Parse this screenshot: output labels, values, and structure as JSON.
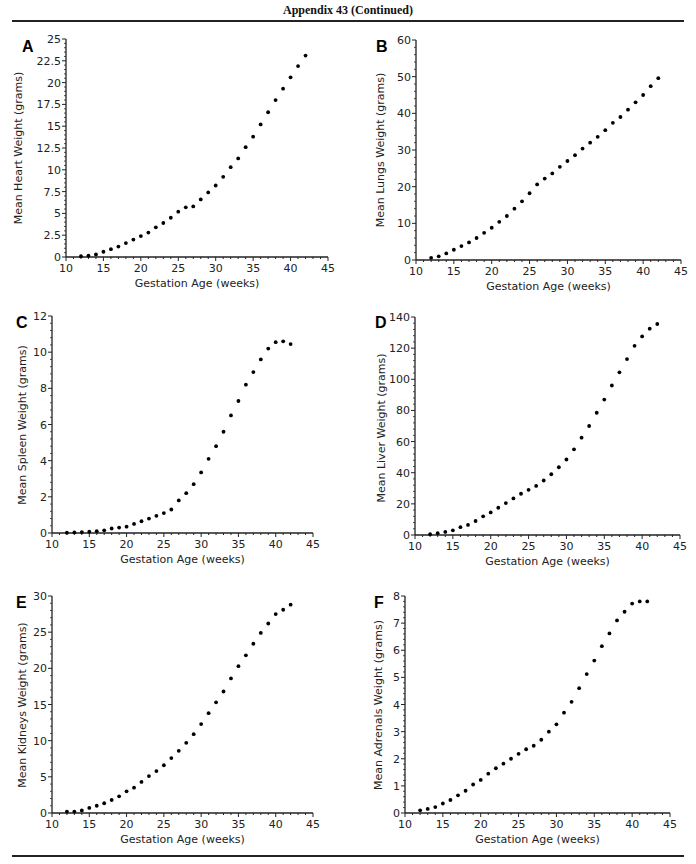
{
  "header": {
    "title": "Appendix 43 (Continued)"
  },
  "footer": {
    "text_partially_visible": ""
  },
  "chart_data": [
    {
      "id": "A",
      "type": "scatter",
      "title": "",
      "panel_label": "A",
      "xlabel": "Gestation Age (weeks)",
      "ylabel": "Mean Heart Weight (grams)",
      "xlim": [
        10,
        45
      ],
      "ylim": [
        0,
        25
      ],
      "xticks": [
        10,
        15,
        20,
        25,
        30,
        35,
        40,
        45
      ],
      "yticks": [
        0,
        2.5,
        5,
        7.5,
        10,
        12.5,
        15,
        17.5,
        20,
        22.5,
        25
      ],
      "ytick_labels": [
        "0",
        "2.5",
        "5",
        "7.5",
        "10",
        "12.5",
        "15",
        "17.5",
        "20",
        "22.5",
        "25"
      ],
      "x": [
        12,
        13,
        14,
        15,
        16,
        17,
        18,
        19,
        20,
        21,
        22,
        23,
        24,
        25,
        26,
        27,
        28,
        29,
        30,
        31,
        32,
        33,
        34,
        35,
        36,
        37,
        38,
        39,
        40,
        41,
        42
      ],
      "y": [
        0.1,
        0.15,
        0.3,
        0.6,
        0.9,
        1.2,
        1.6,
        2.0,
        2.4,
        2.8,
        3.4,
        3.9,
        4.5,
        5.2,
        5.7,
        5.8,
        6.6,
        7.4,
        8.2,
        9.2,
        10.3,
        11.3,
        12.6,
        13.8,
        15.2,
        16.6,
        18.0,
        19.3,
        20.6,
        21.9,
        23.1
      ],
      "plot_px": {
        "x0": 66,
        "x1": 328,
        "y0": 257,
        "y1": 39
      },
      "letter_px": [
        22,
        52
      ],
      "ylabel_px": [
        22,
        148
      ]
    },
    {
      "id": "B",
      "type": "scatter",
      "title": "",
      "panel_label": "B",
      "xlabel": "Gestation Age (weeks)",
      "ylabel": "Mean Lungs Weight (grams)",
      "xlim": [
        10,
        45
      ],
      "ylim": [
        0,
        60
      ],
      "xticks": [
        10,
        15,
        20,
        25,
        30,
        35,
        40,
        45
      ],
      "yticks": [
        0,
        10,
        20,
        30,
        40,
        50,
        60
      ],
      "ytick_labels": [
        "0",
        "10",
        "20",
        "30",
        "40",
        "50",
        "60"
      ],
      "x": [
        12,
        13,
        14,
        15,
        16,
        17,
        18,
        19,
        20,
        21,
        22,
        23,
        24,
        25,
        26,
        27,
        28,
        29,
        30,
        31,
        32,
        33,
        34,
        35,
        36,
        37,
        38,
        39,
        40,
        41,
        42
      ],
      "y": [
        0.6,
        1.0,
        1.8,
        2.8,
        3.8,
        4.8,
        6.0,
        7.4,
        8.8,
        10.4,
        12.0,
        14.0,
        16.0,
        18.2,
        20.6,
        22.2,
        23.6,
        25.4,
        27.0,
        28.6,
        30.4,
        32.0,
        33.6,
        35.4,
        37.4,
        39.0,
        41.0,
        43.0,
        45.0,
        47.4,
        49.6
      ],
      "plot_px": {
        "x0": 416,
        "x1": 681,
        "y0": 260,
        "y1": 40
      },
      "letter_px": [
        376,
        52
      ],
      "ylabel_px": [
        384,
        150
      ]
    },
    {
      "id": "C",
      "type": "scatter",
      "title": "",
      "panel_label": "C",
      "xlabel": "Gestation Age (weeks)",
      "ylabel": "Mean Spleen Weight (grams)",
      "xlim": [
        10,
        45
      ],
      "ylim": [
        0,
        12
      ],
      "xticks": [
        10,
        15,
        20,
        25,
        30,
        35,
        40,
        45
      ],
      "yticks": [
        0,
        2,
        4,
        6,
        8,
        10,
        12
      ],
      "ytick_labels": [
        "0",
        "2",
        "4",
        "6",
        "8",
        "10",
        "12"
      ],
      "x": [
        12,
        13,
        14,
        15,
        16,
        17,
        18,
        19,
        20,
        21,
        22,
        23,
        24,
        25,
        26,
        27,
        28,
        29,
        30,
        31,
        32,
        33,
        34,
        35,
        36,
        37,
        38,
        39,
        40,
        41,
        42
      ],
      "y": [
        0.02,
        0.03,
        0.05,
        0.07,
        0.1,
        0.15,
        0.25,
        0.3,
        0.35,
        0.5,
        0.65,
        0.8,
        0.95,
        1.1,
        1.3,
        1.8,
        2.2,
        2.7,
        3.35,
        4.1,
        4.8,
        5.6,
        6.5,
        7.3,
        8.2,
        8.9,
        9.6,
        10.2,
        10.55,
        10.6,
        10.45
      ],
      "plot_px": {
        "x0": 52,
        "x1": 313,
        "y0": 533,
        "y1": 316
      },
      "letter_px": [
        16,
        328
      ],
      "ylabel_px": [
        26,
        425
      ]
    },
    {
      "id": "D",
      "type": "scatter",
      "title": "",
      "panel_label": "D",
      "xlabel": "Gestation Age (weeks)",
      "ylabel": "Mean Liver Weight (grams)",
      "xlim": [
        10,
        45
      ],
      "ylim": [
        0,
        140
      ],
      "xticks": [
        10,
        15,
        20,
        25,
        30,
        35,
        40,
        45
      ],
      "yticks": [
        0,
        20,
        40,
        60,
        80,
        100,
        120,
        140
      ],
      "ytick_labels": [
        "0",
        "20",
        "40",
        "60",
        "80",
        "100",
        "120",
        "140"
      ],
      "x": [
        12,
        13,
        14,
        15,
        16,
        17,
        18,
        19,
        20,
        21,
        22,
        23,
        24,
        25,
        26,
        27,
        28,
        29,
        30,
        31,
        32,
        33,
        34,
        35,
        36,
        37,
        38,
        39,
        40,
        41,
        42
      ],
      "y": [
        0.5,
        1.2,
        2.0,
        3.0,
        5.0,
        6.5,
        9.0,
        12.0,
        14.5,
        17.5,
        20.5,
        23.5,
        26.5,
        29.0,
        31.5,
        35.0,
        39.0,
        43.5,
        48.5,
        55.0,
        62.5,
        70.0,
        78.5,
        87.0,
        96.0,
        104.5,
        113.0,
        121.5,
        127.5,
        132.5,
        135.5
      ],
      "plot_px": {
        "x0": 415,
        "x1": 680,
        "y0": 535,
        "y1": 317
      },
      "letter_px": [
        375,
        328
      ],
      "ylabel_px": [
        385,
        428
      ]
    },
    {
      "id": "E",
      "type": "scatter",
      "title": "",
      "panel_label": "E",
      "xlabel": "Gestation Age (weeks)",
      "ylabel": "Mean Kidneys Weight (grams)",
      "xlim": [
        10,
        45
      ],
      "ylim": [
        0,
        30
      ],
      "xticks": [
        10,
        15,
        20,
        25,
        30,
        35,
        40,
        45
      ],
      "yticks": [
        0,
        5,
        10,
        15,
        20,
        25,
        30
      ],
      "ytick_labels": [
        "0",
        "5",
        "10",
        "15",
        "20",
        "25",
        "30"
      ],
      "x": [
        12,
        13,
        14,
        15,
        16,
        17,
        18,
        19,
        20,
        21,
        22,
        23,
        24,
        25,
        26,
        27,
        28,
        29,
        30,
        31,
        32,
        33,
        34,
        35,
        36,
        37,
        38,
        39,
        40,
        41,
        42
      ],
      "y": [
        0.2,
        0.2,
        0.35,
        0.7,
        1.0,
        1.35,
        1.8,
        2.3,
        3.0,
        3.5,
        4.3,
        5.1,
        5.8,
        6.6,
        7.6,
        8.6,
        9.7,
        10.9,
        12.3,
        13.8,
        15.3,
        16.8,
        18.6,
        20.3,
        21.8,
        23.4,
        24.9,
        26.2,
        27.5,
        28.1,
        28.8
      ],
      "plot_px": {
        "x0": 52,
        "x1": 313,
        "y0": 813,
        "y1": 596
      },
      "letter_px": [
        16,
        608
      ],
      "ylabel_px": [
        26,
        705
      ]
    },
    {
      "id": "F",
      "type": "scatter",
      "title": "",
      "panel_label": "F",
      "xlabel": "Gestation Age (weeks)",
      "ylabel": "Mean Adrenals Weight (grams)",
      "xlim": [
        10,
        45
      ],
      "ylim": [
        0,
        8
      ],
      "xticks": [
        10,
        15,
        20,
        25,
        30,
        35,
        40,
        45
      ],
      "yticks": [
        0,
        1,
        2,
        3,
        4,
        5,
        6,
        7,
        8
      ],
      "ytick_labels": [
        "0",
        "1",
        "2",
        "3",
        "4",
        "5",
        "6",
        "7",
        "8"
      ],
      "x": [
        12,
        13,
        14,
        15,
        16,
        17,
        18,
        19,
        20,
        21,
        22,
        23,
        24,
        25,
        26,
        27,
        28,
        29,
        30,
        31,
        32,
        33,
        34,
        35,
        36,
        37,
        38,
        39,
        40,
        41,
        42
      ],
      "y": [
        0.1,
        0.15,
        0.22,
        0.35,
        0.48,
        0.65,
        0.82,
        1.05,
        1.22,
        1.45,
        1.65,
        1.82,
        2.0,
        2.18,
        2.35,
        2.48,
        2.7,
        3.0,
        3.27,
        3.7,
        4.1,
        4.6,
        5.12,
        5.62,
        6.15,
        6.62,
        7.1,
        7.42,
        7.72,
        7.8,
        7.8
      ],
      "plot_px": {
        "x0": 405,
        "x1": 670,
        "y0": 813,
        "y1": 596
      },
      "letter_px": [
        374,
        608
      ],
      "ylabel_px": [
        382,
        705
      ]
    }
  ]
}
